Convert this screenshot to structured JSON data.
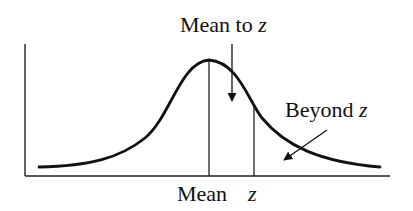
{
  "diagram": {
    "type": "normal-distribution",
    "labels": {
      "top": {
        "text": "Mean to ",
        "var": "z"
      },
      "right": {
        "text": "Beyond ",
        "var": "z"
      },
      "axis_mean": "Mean",
      "axis_z": "z"
    },
    "colors": {
      "stroke": "#111111",
      "background": "#ffffff"
    }
  }
}
